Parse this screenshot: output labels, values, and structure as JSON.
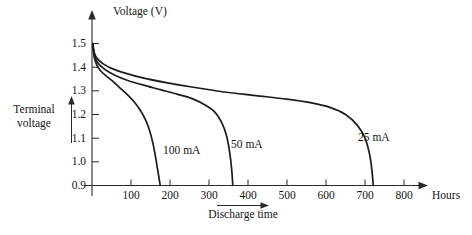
{
  "chart_data": {
    "type": "line",
    "title": "",
    "xlabel": "Discharge time",
    "ylabel": "Terminal voltage",
    "x_axis_title": "Hours",
    "y_axis_title": "Voltage (V)",
    "xlim": [
      0,
      850
    ],
    "ylim": [
      0.9,
      1.55
    ],
    "grid": false,
    "legend": "inline-annotations",
    "xticks": [
      100,
      200,
      300,
      400,
      500,
      600,
      700,
      800
    ],
    "xtick_labels": [
      "100",
      "200",
      "300",
      "400",
      "500",
      "600",
      "700",
      "800"
    ],
    "yticks": [
      0.9,
      1.0,
      1.1,
      1.2,
      1.3,
      1.4,
      1.5
    ],
    "ytick_labels": [
      "0.9",
      "1.0",
      "1.1",
      "1.2",
      "1.3",
      "1.4",
      "1.5"
    ],
    "series": [
      {
        "name": "100 mA",
        "label": "100 mA",
        "points": [
          [
            2,
            1.5
          ],
          [
            6,
            1.44
          ],
          [
            12,
            1.41
          ],
          [
            22,
            1.385
          ],
          [
            35,
            1.365
          ],
          [
            50,
            1.345
          ],
          [
            70,
            1.315
          ],
          [
            90,
            1.285
          ],
          [
            110,
            1.25
          ],
          [
            125,
            1.215
          ],
          [
            138,
            1.175
          ],
          [
            148,
            1.13
          ],
          [
            156,
            1.08
          ],
          [
            163,
            1.02
          ],
          [
            168,
            0.97
          ],
          [
            172,
            0.93
          ],
          [
            175,
            0.9
          ]
        ],
        "end_hours": 175
      },
      {
        "name": "50 mA",
        "label": "50 mA",
        "points": [
          [
            2,
            1.5
          ],
          [
            6,
            1.45
          ],
          [
            12,
            1.425
          ],
          [
            22,
            1.405
          ],
          [
            38,
            1.385
          ],
          [
            60,
            1.365
          ],
          [
            90,
            1.345
          ],
          [
            130,
            1.325
          ],
          [
            175,
            1.305
          ],
          [
            220,
            1.285
          ],
          [
            260,
            1.265
          ],
          [
            290,
            1.24
          ],
          [
            315,
            1.21
          ],
          [
            333,
            1.165
          ],
          [
            345,
            1.11
          ],
          [
            353,
            1.04
          ],
          [
            358,
            0.97
          ],
          [
            361,
            0.9
          ]
        ],
        "end_hours": 361
      },
      {
        "name": "25 mA",
        "label": "25 mA",
        "points": [
          [
            2,
            1.5
          ],
          [
            6,
            1.46
          ],
          [
            14,
            1.435
          ],
          [
            28,
            1.415
          ],
          [
            50,
            1.395
          ],
          [
            85,
            1.375
          ],
          [
            130,
            1.355
          ],
          [
            190,
            1.335
          ],
          [
            260,
            1.315
          ],
          [
            340,
            1.295
          ],
          [
            420,
            1.28
          ],
          [
            500,
            1.265
          ],
          [
            560,
            1.25
          ],
          [
            610,
            1.23
          ],
          [
            650,
            1.2
          ],
          [
            680,
            1.155
          ],
          [
            700,
            1.1
          ],
          [
            712,
            1.03
          ],
          [
            718,
            0.96
          ],
          [
            721,
            0.9
          ]
        ],
        "end_hours": 721
      }
    ],
    "annotations": [
      {
        "text": "100 mA",
        "x_hours": 190,
        "y_volts": 1.05
      },
      {
        "text": "50 mA",
        "x_hours": 370,
        "y_volts": 1.09
      },
      {
        "text": "25 mA",
        "x_hours": 700,
        "y_volts": 1.14
      },
      {
        "text": "Terminal voltage",
        "position": "left-of-y-axis"
      },
      {
        "text": "Discharge time",
        "position": "below-x-axis"
      }
    ]
  },
  "labels": {
    "y_axis_title": "Voltage (V)",
    "x_axis_end_label": "Hours",
    "terminal_voltage_line1": "Terminal",
    "terminal_voltage_line2": "voltage",
    "discharge_time": "Discharge time",
    "series_100ma": "100 mA",
    "series_50ma": "50 mA",
    "series_25ma": "25 mA",
    "ytick_15": "1.5",
    "ytick_14": "1.4",
    "ytick_13": "1.3",
    "ytick_12": "1.2",
    "ytick_11": "1.1",
    "ytick_10": "1.0",
    "ytick_09": "0.9",
    "xtick_100": "100",
    "xtick_200": "200",
    "xtick_300": "300",
    "xtick_400": "400",
    "xtick_500": "500",
    "xtick_600": "600",
    "xtick_700": "700",
    "xtick_800": "800"
  },
  "colors": {
    "background": "#ffffff",
    "axis": "#2a2a2a",
    "curve": "#1c1c1c",
    "text": "#151515"
  }
}
